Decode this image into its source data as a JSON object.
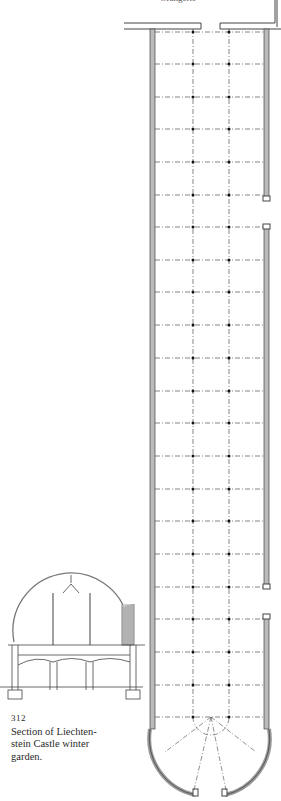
{
  "figure": {
    "header_fragment": "Orangerie",
    "number": "312",
    "caption": "Section of Liechten- stein Castle winter garden.",
    "caption_lines": [
      "Section of Liechten-",
      "stein Castle winter",
      "garden."
    ]
  },
  "plan": {
    "row_y": [
      32,
      64,
      97,
      129,
      162,
      195,
      227,
      260,
      292,
      325,
      358,
      391,
      423,
      456,
      489,
      521,
      554,
      587,
      619,
      652,
      685,
      717
    ],
    "column_x": [
      193,
      229
    ],
    "left_wall_x": 152,
    "right_wall_x": 266,
    "right_wall_gaps": [
      [
        200,
        226
      ],
      [
        588,
        617
      ]
    ],
    "line_color": "#333333"
  }
}
